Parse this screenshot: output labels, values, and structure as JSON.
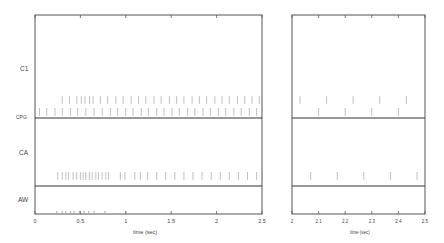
{
  "chart_data": [
    {
      "type": "scatter",
      "subtype": "raster",
      "title": "",
      "xlabel": "time (sec)",
      "ylabel": "",
      "xlim": [
        0,
        2.5
      ],
      "xticks": [
        0,
        0.5,
        1,
        1.5,
        2,
        2.5
      ],
      "xtick_labels": [
        "0",
        "0.5",
        "1",
        "1.5",
        "2",
        "2.5"
      ],
      "row_labels": [
        "C1",
        "CPG",
        "CA",
        "AW"
      ],
      "grid": false,
      "series": [
        {
          "name": "C1",
          "row_y": 0.45,
          "values": [
            0.3,
            0.38,
            0.46,
            0.51,
            0.55,
            0.6,
            0.64,
            0.72,
            0.8,
            0.89,
            0.97,
            1.06,
            1.14,
            1.22,
            1.31,
            1.39,
            1.48,
            1.56,
            1.64,
            1.73,
            1.81,
            1.89,
            1.98,
            2.06,
            2.14,
            2.23,
            2.31,
            2.39,
            2.47
          ]
        },
        {
          "name": "CPG",
          "row_y": 0.9,
          "values": [
            0.05,
            0.13,
            0.22,
            0.3,
            0.39,
            0.47,
            0.56,
            0.65,
            0.74,
            0.83,
            0.91,
            1.0,
            1.08,
            1.17,
            1.25,
            1.34,
            1.42,
            1.51,
            1.59,
            1.68,
            1.76,
            1.85,
            1.93,
            2.02,
            2.1,
            2.19,
            2.27,
            2.36,
            2.44
          ]
        },
        {
          "name": "CA",
          "row_y": 0.82,
          "values": [
            0.25,
            0.3,
            0.34,
            0.37,
            0.42,
            0.46,
            0.5,
            0.53,
            0.56,
            0.6,
            0.63,
            0.67,
            0.7,
            0.74,
            0.78,
            0.81,
            0.94,
            0.99,
            1.1,
            1.16,
            1.24,
            1.34,
            1.44,
            1.54,
            1.64,
            1.74,
            1.84,
            1.94,
            2.04,
            2.14,
            2.24,
            2.34,
            2.44
          ]
        },
        {
          "name": "AW",
          "row_y": 0.85,
          "values": [
            0.24,
            0.3,
            0.34,
            0.39,
            0.43,
            0.49,
            0.54,
            0.59,
            0.65,
            0.77,
            1.0
          ]
        }
      ]
    },
    {
      "type": "scatter",
      "subtype": "raster",
      "title": "",
      "xlabel": "time (sec)",
      "ylabel": "",
      "xlim": [
        2,
        2.5
      ],
      "xticks": [
        2,
        2.1,
        2.2,
        2.3,
        2.4,
        2.5
      ],
      "xtick_labels": [
        "2",
        "2.1",
        "2.2",
        "2.3",
        "2.4",
        "2.5"
      ],
      "row_labels": [
        "C1",
        "CPG",
        "CA",
        "AW"
      ],
      "grid": false,
      "series": [
        {
          "name": "C1",
          "row_y": 0.45,
          "values": [
            2.03,
            2.13,
            2.23,
            2.33,
            2.43
          ]
        },
        {
          "name": "CPG",
          "row_y": 0.9,
          "values": [
            2.1,
            2.2,
            2.3,
            2.4
          ]
        },
        {
          "name": "CA",
          "row_y": 0.82,
          "values": [
            2.07,
            2.17,
            2.27,
            2.37,
            2.47
          ]
        },
        {
          "name": "AW",
          "row_y": 0.85,
          "values": []
        }
      ]
    }
  ],
  "labels": {
    "row_c1": "C1",
    "row_cpg": "CPG",
    "row_ca": "CA",
    "row_aw": "AW",
    "xlabel_left": "time (sec)",
    "xlabel_right": "time (sec)"
  }
}
